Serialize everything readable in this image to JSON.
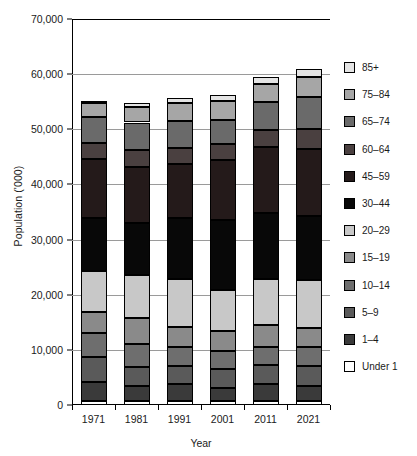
{
  "chart_data": {
    "type": "bar",
    "stacked": true,
    "title": "",
    "xlabel": "Year",
    "ylabel": "Population ('000)",
    "categories": [
      "1971",
      "1981",
      "1991",
      "2001",
      "2011",
      "2021"
    ],
    "ylim": [
      0,
      70000
    ],
    "yticks": [
      0,
      10000,
      20000,
      30000,
      40000,
      50000,
      60000,
      70000
    ],
    "ytick_labels": [
      "0",
      "10,000",
      "20,000",
      "30,000",
      "40,000",
      "50,000",
      "60,000",
      "70,000"
    ],
    "grid": true,
    "legend_position": "right",
    "series": [
      {
        "name": "Under 1",
        "color": "#ffffff",
        "values": [
          800,
          730,
          780,
          670,
          800,
          690
        ]
      },
      {
        "name": "1–4",
        "color": "#3a3a3a",
        "values": [
          3400,
          2700,
          3100,
          2500,
          3000,
          2700
        ]
      },
      {
        "name": "5–9",
        "color": "#5a5a5a",
        "values": [
          4500,
          3400,
          3200,
          3300,
          3400,
          3600
        ]
      },
      {
        "name": "10–14",
        "color": "#6e6e6e",
        "values": [
          4300,
          4300,
          3400,
          3400,
          3300,
          3600
        ]
      },
      {
        "name": "15–19",
        "color": "#8a8a8a",
        "values": [
          3800,
          4600,
          3700,
          3600,
          4000,
          3400
        ]
      },
      {
        "name": "20–29",
        "color": "#c8c8c8",
        "values": [
          7500,
          7900,
          8600,
          7300,
          8300,
          8600
        ]
      },
      {
        "name": "30–44",
        "color": "#080808",
        "values": [
          9700,
          9400,
          11100,
          12700,
          12000,
          11600
        ]
      },
      {
        "name": "45–59",
        "color": "#241a1a",
        "values": [
          10600,
          10100,
          9900,
          11000,
          11900,
          12200
        ]
      },
      {
        "name": "60–64",
        "color": "#4a4040",
        "values": [
          2900,
          3100,
          2800,
          2800,
          3100,
          3600
        ]
      },
      {
        "name": "65–74",
        "color": "#6a6a6a",
        "values": [
          4700,
          5000,
          5000,
          4400,
          5100,
          5900
        ]
      },
      {
        "name": "75–84",
        "color": "#a6a6a6",
        "values": [
          2500,
          2900,
          3100,
          3500,
          3300,
          3600
        ]
      },
      {
        "name": "85+",
        "color": "#e4e4e4",
        "values": [
          500,
          700,
          1000,
          1100,
          1300,
          1500
        ]
      }
    ],
    "totals": [
      55800,
      56000,
      57000,
      59000,
      60700,
      62000
    ]
  },
  "axes": {
    "y_title": "Population ('000)",
    "x_title": "Year"
  },
  "legend": {
    "entries": [
      {
        "label": "85+",
        "color": "#e4e4e4"
      },
      {
        "label": "75–84",
        "color": "#a6a6a6"
      },
      {
        "label": "65–74",
        "color": "#6a6a6a"
      },
      {
        "label": "60–64",
        "color": "#4a4040"
      },
      {
        "label": "45–59",
        "color": "#241a1a"
      },
      {
        "label": "30–44",
        "color": "#080808"
      },
      {
        "label": "20–29",
        "color": "#c8c8c8"
      },
      {
        "label": "15–19",
        "color": "#8a8a8a"
      },
      {
        "label": "10–14",
        "color": "#6e6e6e"
      },
      {
        "label": "5–9",
        "color": "#5a5a5a"
      },
      {
        "label": "1–4",
        "color": "#3a3a3a"
      },
      {
        "label": "Under 1",
        "color": "#ffffff"
      }
    ]
  }
}
